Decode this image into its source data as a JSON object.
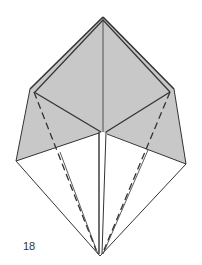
{
  "diagram": {
    "type": "origami-fold-step",
    "step_number": "18",
    "colors": {
      "colored_side": "#c8c8c8",
      "white_side": "#ffffff",
      "line": "#333333"
    },
    "lines": {
      "valley_fold": "dashed",
      "edges": "solid"
    }
  }
}
